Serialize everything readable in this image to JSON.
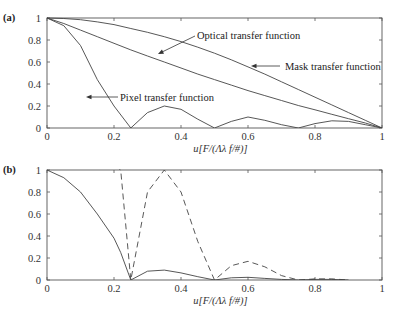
{
  "chart_data": [
    {
      "panel": "(a)",
      "type": "line",
      "xlabel": "u[F/(Λλ f/#)]",
      "ylabel": "",
      "xlim": [
        0,
        1
      ],
      "ylim": [
        0,
        1
      ],
      "xticks": [
        "0",
        "0.2",
        "0.4",
        "0.6",
        "0.8",
        "1"
      ],
      "yticks": [
        "0",
        "0.2",
        "0.4",
        "0.6",
        "0.8",
        "1"
      ],
      "grid": false,
      "annotations": [
        "Optical transfer function",
        "Mask transfer function",
        "Pixel transfer function"
      ],
      "x": [
        0,
        0.05,
        0.1,
        0.15,
        0.2,
        0.25,
        0.3,
        0.35,
        0.4,
        0.45,
        0.5,
        0.55,
        0.6,
        0.65,
        0.7,
        0.75,
        0.8,
        0.85,
        0.9,
        0.95,
        1.0
      ],
      "series": [
        {
          "name": "Optical transfer function",
          "style": "solid",
          "values": [
            1.0,
            0.995,
            0.985,
            0.965,
            0.94,
            0.905,
            0.87,
            0.83,
            0.785,
            0.735,
            0.68,
            0.62,
            0.555,
            0.49,
            0.42,
            0.35,
            0.28,
            0.21,
            0.14,
            0.07,
            0.0
          ]
        },
        {
          "name": "Mask transfer function",
          "style": "solid",
          "values": [
            1.0,
            0.95,
            0.89,
            0.83,
            0.77,
            0.71,
            0.655,
            0.6,
            0.545,
            0.49,
            0.44,
            0.39,
            0.34,
            0.295,
            0.25,
            0.205,
            0.165,
            0.125,
            0.085,
            0.045,
            0.0
          ]
        },
        {
          "name": "Pixel transfer function",
          "style": "solid",
          "values": [
            1.0,
            0.93,
            0.75,
            0.44,
            0.2,
            0.0,
            0.14,
            0.2,
            0.17,
            0.08,
            0.0,
            0.06,
            0.1,
            0.07,
            0.03,
            0.0,
            0.04,
            0.065,
            0.06,
            0.03,
            0.0
          ]
        }
      ]
    },
    {
      "panel": "(b)",
      "type": "line",
      "xlabel": "u[F/(Λλ f/#)]",
      "ylabel": "",
      "xlim": [
        0,
        1
      ],
      "ylim": [
        0,
        1
      ],
      "xticks": [
        "0",
        "0.2",
        "0.4",
        "0.6",
        "0.8",
        "1"
      ],
      "yticks": [
        "0",
        "0.2",
        "0.4",
        "0.6",
        "0.8",
        "1"
      ],
      "grid": false,
      "x": [
        0,
        0.05,
        0.1,
        0.15,
        0.2,
        0.22,
        0.25,
        0.3,
        0.35,
        0.4,
        0.45,
        0.5,
        0.55,
        0.6,
        0.65,
        0.7,
        0.75,
        0.8,
        0.85,
        0.9
      ],
      "series": [
        {
          "name": "solid",
          "style": "solid",
          "values": [
            1.0,
            0.93,
            0.8,
            0.6,
            0.38,
            0.25,
            0.0,
            0.08,
            0.09,
            0.065,
            0.03,
            0.0,
            0.02,
            0.025,
            0.015,
            0.005,
            0.0,
            0.005,
            0.005,
            0.0
          ]
        },
        {
          "name": "dashed",
          "style": "dashed",
          "values": [
            null,
            null,
            null,
            null,
            null,
            1.0,
            0.0,
            0.8,
            1.0,
            0.8,
            0.35,
            0.0,
            0.13,
            0.17,
            0.12,
            0.04,
            0.0,
            0.01,
            0.01,
            0.0
          ]
        }
      ]
    }
  ]
}
